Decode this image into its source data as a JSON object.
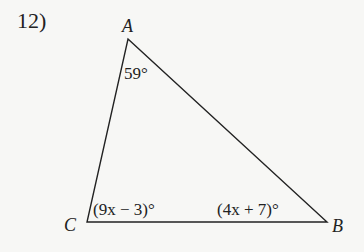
{
  "problem": {
    "number": "12)"
  },
  "triangle": {
    "vertices": {
      "A": {
        "label": "A",
        "x": 128,
        "y": 39
      },
      "B": {
        "label": "B",
        "x": 327,
        "y": 222
      },
      "C": {
        "label": "C",
        "x": 87,
        "y": 222
      }
    },
    "angles": {
      "A": "59°",
      "C": "(9x − 3)°",
      "B": "(4x + 7)°"
    }
  }
}
